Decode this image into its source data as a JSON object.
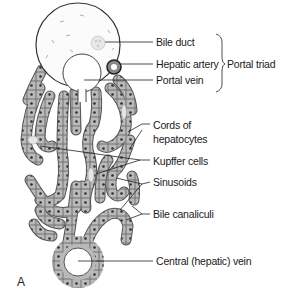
{
  "figure": {
    "panel_letter": "A",
    "labels": {
      "bile_duct": "Bile duct",
      "hepatic_artery": "Hepatic artery",
      "portal_vein": "Portal vein",
      "portal_triad": "Portal triad",
      "cords_line1": "Cords of",
      "cords_line2": "hepatocytes",
      "kupffer": "Kupffer cells",
      "sinusoids": "Sinusoids",
      "bile_canaliculi": "Bile canaliculi",
      "central_vein": "Central (hepatic) vein"
    },
    "colors": {
      "cell_fill": "#b9b9b9",
      "cell_border": "#5a5a5a",
      "nucleus": "#2e2e2e",
      "line": "#222222",
      "portal_fill": "#fbfbfb"
    }
  }
}
